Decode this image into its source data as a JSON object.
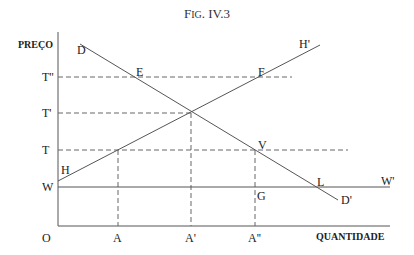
{
  "figure": {
    "title_prefix": "F",
    "title_small": "IG",
    "title_rest": ". IV.3"
  },
  "axes": {
    "y_label": "PREÇO",
    "x_label": "QUANTIDADE",
    "origin_label": "O"
  },
  "y_ticks": [
    {
      "label": "T''",
      "y": 77
    },
    {
      "label": "T'",
      "y": 113
    },
    {
      "label": "T",
      "y": 150
    },
    {
      "label": "W",
      "y": 187
    }
  ],
  "x_ticks": [
    {
      "label": "A",
      "x": 118
    },
    {
      "label": "A'",
      "x": 191
    },
    {
      "label": "A''",
      "x": 255
    }
  ],
  "lines": {
    "demand": {
      "start_label": "D",
      "end_label": "D'",
      "x1": 80,
      "y1": 44,
      "x2": 338,
      "y2": 200
    },
    "supply": {
      "start_label": "H",
      "end_label": "H'",
      "x1": 58,
      "y1": 181,
      "x2": 320,
      "y2": 45
    },
    "world_price": {
      "start_label": "W",
      "end_label": "W'",
      "x1": 58,
      "y1": 187,
      "x2": 390,
      "y2": 187
    }
  },
  "points": {
    "E": "E",
    "F": "F",
    "V": "V",
    "G": "G",
    "L": "L"
  },
  "colors": {
    "line": "#555555",
    "dash": "#666666",
    "text": "#222222"
  }
}
